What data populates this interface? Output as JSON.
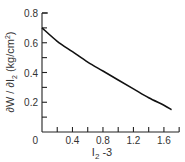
{
  "chart_data": {
    "type": "line",
    "title": "",
    "xlabel": "I2 - 3",
    "ylabel": "∂W / ∂I2 (kg/cm²)",
    "xlim": [
      0,
      1.8
    ],
    "ylim": [
      0,
      0.8
    ],
    "x_ticks": [
      "0",
      "0.4",
      "0.8",
      "1.2",
      "1.6"
    ],
    "y_ticks": [
      "0",
      "0.2",
      "0.4",
      "0.6",
      "0.8"
    ],
    "grid": false,
    "legend": null,
    "series": [
      {
        "name": "dW/dI2",
        "x": [
          0,
          0.2,
          0.4,
          0.6,
          0.8,
          1.0,
          1.2,
          1.4,
          1.6,
          1.7
        ],
        "y": [
          0.7,
          0.61,
          0.54,
          0.47,
          0.41,
          0.35,
          0.29,
          0.23,
          0.18,
          0.15
        ]
      }
    ]
  },
  "labels": {
    "x_axis": "I",
    "x_axis_sub": "2",
    "x_axis_suffix": " -3",
    "y_axis": "∂W / ∂I",
    "y_axis_sub": "2",
    "y_axis_suffix": " (kg/cm",
    "y_axis_sup": "2",
    "y_axis_end": ")"
  }
}
